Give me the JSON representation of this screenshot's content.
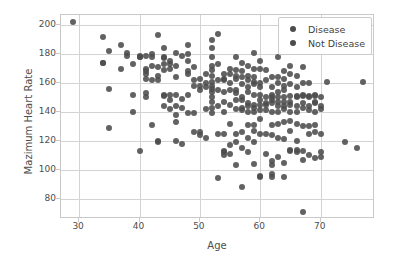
{
  "chart_data": {
    "type": "scatter",
    "title": "",
    "xlabel": "Age",
    "ylabel": "Mazimum Heart Rate",
    "xlim": [
      27,
      79
    ],
    "ylim": [
      66,
      207
    ],
    "xticks": [
      30,
      40,
      50,
      60,
      70
    ],
    "yticks": [
      80,
      100,
      120,
      140,
      160,
      180,
      200
    ],
    "grid": true,
    "legend_position": "upper right",
    "marker_color": "#4c4c4c",
    "grid_color": "#d3d3d3",
    "axes_color": "#c9c9c9",
    "background_color": "#ffffff",
    "series": [
      {
        "name": "Disease",
        "color": "#4c4c4c",
        "points": [
          [
            29,
            202
          ],
          [
            34,
            192
          ],
          [
            34,
            174
          ],
          [
            34,
            174
          ],
          [
            35,
            182
          ],
          [
            35,
            156
          ],
          [
            35,
            129
          ],
          [
            37,
            186
          ],
          [
            37,
            170
          ],
          [
            38,
            181
          ],
          [
            38,
            179
          ],
          [
            39,
            173
          ],
          [
            39,
            152
          ],
          [
            39,
            140
          ],
          [
            40,
            179
          ],
          [
            40,
            178
          ],
          [
            40,
            178
          ],
          [
            40,
            113
          ],
          [
            41,
            179
          ],
          [
            41,
            170
          ],
          [
            41,
            168
          ],
          [
            41,
            166
          ],
          [
            41,
            163
          ],
          [
            41,
            153
          ],
          [
            41,
            150
          ],
          [
            42,
            180
          ],
          [
            42,
            178
          ],
          [
            42,
            172
          ],
          [
            42,
            162
          ],
          [
            42,
            131
          ],
          [
            43,
            193
          ],
          [
            43,
            171
          ],
          [
            43,
            165
          ],
          [
            43,
            162
          ],
          [
            43,
            120
          ],
          [
            43,
            119
          ],
          [
            44,
            184
          ],
          [
            44,
            178
          ],
          [
            44,
            177
          ],
          [
            44,
            173
          ],
          [
            44,
            169
          ],
          [
            44,
            152
          ],
          [
            44,
            151
          ],
          [
            44,
            144
          ],
          [
            45,
            175
          ],
          [
            45,
            173
          ],
          [
            45,
            170
          ],
          [
            45,
            152
          ],
          [
            45,
            148
          ],
          [
            45,
            142
          ],
          [
            46,
            181
          ],
          [
            46,
            172
          ],
          [
            46,
            164
          ],
          [
            46,
            152
          ],
          [
            46,
            144
          ],
          [
            46,
            138
          ],
          [
            46,
            133
          ],
          [
            46,
            120
          ],
          [
            47,
            179
          ],
          [
            47,
            149
          ],
          [
            47,
            143
          ],
          [
            47,
            118
          ],
          [
            48,
            186
          ],
          [
            48,
            180
          ],
          [
            48,
            175
          ],
          [
            48,
            168
          ],
          [
            48,
            166
          ],
          [
            48,
            152
          ],
          [
            48,
            139
          ],
          [
            49,
            171
          ],
          [
            49,
            162
          ],
          [
            49,
            158
          ],
          [
            49,
            139
          ],
          [
            49,
            126
          ],
          [
            50,
            163
          ],
          [
            50,
            158
          ],
          [
            50,
            155
          ],
          [
            50,
            126
          ],
          [
            50,
            124
          ],
          [
            51,
            166
          ],
          [
            51,
            160
          ],
          [
            51,
            157
          ],
          [
            51,
            142
          ],
          [
            51,
            122
          ],
          [
            52,
            190
          ],
          [
            52,
            184
          ],
          [
            52,
            178
          ],
          [
            52,
            172
          ],
          [
            52,
            169
          ],
          [
            52,
            165
          ],
          [
            52,
            161
          ],
          [
            52,
            158
          ],
          [
            52,
            156
          ],
          [
            52,
            154
          ],
          [
            52,
            150
          ],
          [
            52,
            147
          ],
          [
            52,
            143
          ],
          [
            52,
            139
          ],
          [
            53,
            194
          ],
          [
            53,
            173
          ],
          [
            53,
            162
          ],
          [
            53,
            155
          ],
          [
            53,
            144
          ],
          [
            53,
            125
          ],
          [
            53,
            94
          ],
          [
            54,
            166
          ],
          [
            54,
            163
          ],
          [
            54,
            162
          ],
          [
            54,
            154
          ],
          [
            54,
            147
          ],
          [
            54,
            140
          ],
          [
            54,
            125
          ],
          [
            54,
            113
          ],
          [
            54,
            112
          ],
          [
            54,
            110
          ],
          [
            55,
            170
          ],
          [
            55,
            166
          ],
          [
            55,
            160
          ],
          [
            55,
            155
          ],
          [
            55,
            145
          ],
          [
            55,
            132
          ],
          [
            55,
            117
          ],
          [
            55,
            111
          ],
          [
            56,
            178
          ],
          [
            56,
            169
          ],
          [
            56,
            165
          ],
          [
            56,
            163
          ],
          [
            56,
            155
          ],
          [
            56,
            153
          ],
          [
            56,
            148
          ],
          [
            56,
            142
          ],
          [
            56,
            125
          ],
          [
            56,
            119
          ],
          [
            56,
            103
          ],
          [
            57,
            174
          ],
          [
            57,
            168
          ],
          [
            57,
            164
          ],
          [
            57,
            159
          ],
          [
            57,
            150
          ],
          [
            57,
            148
          ],
          [
            57,
            143
          ],
          [
            57,
            141
          ],
          [
            57,
            126
          ],
          [
            57,
            115
          ],
          [
            57,
            88
          ],
          [
            58,
            172
          ],
          [
            58,
            165
          ],
          [
            58,
            162
          ],
          [
            58,
            157
          ],
          [
            58,
            154
          ],
          [
            58,
            146
          ],
          [
            58,
            144
          ],
          [
            58,
            140
          ],
          [
            58,
            131
          ],
          [
            58,
            122
          ],
          [
            58,
            112
          ],
          [
            59,
            181
          ],
          [
            59,
            170
          ],
          [
            59,
            164
          ],
          [
            59,
            161
          ],
          [
            59,
            159
          ],
          [
            59,
            152
          ],
          [
            59,
            145
          ],
          [
            59,
            143
          ],
          [
            59,
            140
          ],
          [
            59,
            131
          ],
          [
            59,
            127
          ],
          [
            59,
            119
          ],
          [
            59,
            104
          ],
          [
            60,
            175
          ],
          [
            60,
            170
          ],
          [
            60,
            160
          ],
          [
            60,
            157
          ],
          [
            60,
            152
          ],
          [
            60,
            148
          ],
          [
            60,
            145
          ],
          [
            60,
            141
          ],
          [
            60,
            135
          ],
          [
            60,
            125
          ],
          [
            60,
            96
          ]
        ]
      },
      {
        "name": "Not Disease",
        "color": "#4c4c4c",
        "points": [
          [
            60,
            95
          ],
          [
            61,
            169
          ],
          [
            61,
            162
          ],
          [
            61,
            150
          ],
          [
            61,
            146
          ],
          [
            61,
            145
          ],
          [
            61,
            141
          ],
          [
            61,
            125
          ],
          [
            61,
            111
          ],
          [
            62,
            164
          ],
          [
            62,
            157
          ],
          [
            62,
            152
          ],
          [
            62,
            150
          ],
          [
            62,
            148
          ],
          [
            62,
            146
          ],
          [
            62,
            140
          ],
          [
            62,
            131
          ],
          [
            62,
            124
          ],
          [
            62,
            106
          ],
          [
            62,
            103
          ],
          [
            62,
            97
          ],
          [
            62,
            95
          ],
          [
            63,
            178
          ],
          [
            63,
            164
          ],
          [
            63,
            160
          ],
          [
            63,
            154
          ],
          [
            63,
            150
          ],
          [
            63,
            147
          ],
          [
            63,
            144
          ],
          [
            63,
            140
          ],
          [
            63,
            132
          ],
          [
            63,
            122
          ],
          [
            63,
            109
          ],
          [
            64,
            168
          ],
          [
            64,
            163
          ],
          [
            64,
            158
          ],
          [
            64,
            155
          ],
          [
            64,
            150
          ],
          [
            64,
            147
          ],
          [
            64,
            144
          ],
          [
            64,
            142
          ],
          [
            64,
            133
          ],
          [
            64,
            121
          ],
          [
            64,
            105
          ],
          [
            64,
            95
          ],
          [
            65,
            172
          ],
          [
            65,
            166
          ],
          [
            65,
            159
          ],
          [
            65,
            151
          ],
          [
            65,
            147
          ],
          [
            65,
            145
          ],
          [
            65,
            140
          ],
          [
            65,
            134
          ],
          [
            65,
            127
          ],
          [
            65,
            114
          ],
          [
            65,
            113
          ],
          [
            66,
            165
          ],
          [
            66,
            157
          ],
          [
            66,
            151
          ],
          [
            66,
            150
          ],
          [
            66,
            144
          ],
          [
            66,
            140
          ],
          [
            66,
            132
          ],
          [
            66,
            120
          ],
          [
            66,
            114
          ],
          [
            66,
            112
          ],
          [
            67,
            171
          ],
          [
            67,
            160
          ],
          [
            67,
            152
          ],
          [
            67,
            151
          ],
          [
            67,
            146
          ],
          [
            67,
            143
          ],
          [
            67,
            130
          ],
          [
            67,
            113
          ],
          [
            67,
            107
          ],
          [
            67,
            71
          ],
          [
            68,
            160
          ],
          [
            68,
            151
          ],
          [
            68,
            150
          ],
          [
            68,
            144
          ],
          [
            68,
            141
          ],
          [
            68,
            130
          ],
          [
            68,
            125
          ],
          [
            68,
            110
          ],
          [
            69,
            152
          ],
          [
            69,
            151
          ],
          [
            69,
            147
          ],
          [
            69,
            146
          ],
          [
            69,
            140
          ],
          [
            69,
            131
          ],
          [
            69,
            126
          ],
          [
            69,
            108
          ],
          [
            70,
            150
          ],
          [
            70,
            144
          ],
          [
            70,
            142
          ],
          [
            70,
            125
          ],
          [
            70,
            112
          ],
          [
            70,
            109
          ],
          [
            71,
            161
          ],
          [
            74,
            119
          ],
          [
            76,
            115
          ],
          [
            77,
            161
          ]
        ]
      }
    ]
  },
  "legend": {
    "entries": [
      {
        "label": "Disease",
        "marker": "circle-marker",
        "color": "#4c4c4c"
      },
      {
        "label": "Not Disease",
        "marker": "circle-marker",
        "color": "#4c4c4c"
      }
    ]
  }
}
